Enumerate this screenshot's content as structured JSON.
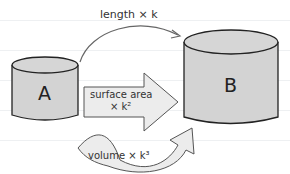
{
  "diagram": {
    "shapes": [
      {
        "id": "A",
        "label": "A",
        "type": "cylinder",
        "size": "small"
      },
      {
        "id": "B",
        "label": "B",
        "type": "cylinder",
        "size": "large"
      }
    ],
    "arrows": [
      {
        "name": "length",
        "label": "length × k",
        "style": "thin-curved"
      },
      {
        "name": "surface",
        "label_line1": "surface area",
        "label_line2": "× k²",
        "style": "block-straight"
      },
      {
        "name": "volume",
        "label": "volume × k³",
        "style": "block-curved"
      }
    ]
  },
  "colors": {
    "cylinder_fill": "#d3d3d3",
    "arrow_fill": "#ececec",
    "stroke": "#222222"
  }
}
